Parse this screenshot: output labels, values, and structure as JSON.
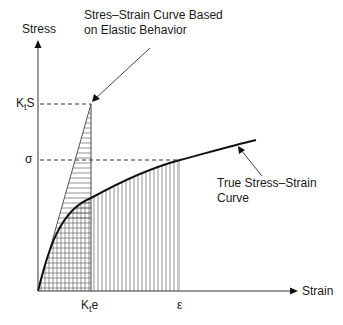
{
  "diagram": {
    "axes": {
      "y_label": "Stress",
      "x_label": "Strain"
    },
    "y_ticks": [
      {
        "main": "K",
        "sub": "t",
        "tail": "S"
      },
      {
        "main": "σ",
        "sub": "",
        "tail": ""
      }
    ],
    "x_ticks": [
      {
        "main": "K",
        "sub": "t",
        "tail": "e"
      },
      {
        "main": "ε",
        "sub": "",
        "tail": ""
      }
    ],
    "annotations": {
      "elastic_line1": "Stres–Strain Curve Based",
      "elastic_line2": "on  Elastic Behavior",
      "true_line1": "True Stress–Strain",
      "true_line2": "Curve"
    },
    "colors": {
      "line": "#1a1a1a",
      "hatch": "#555555",
      "dash": "#333333"
    }
  }
}
